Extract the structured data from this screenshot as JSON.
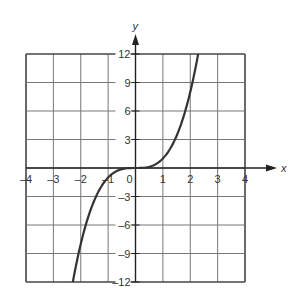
{
  "chart_data": {
    "type": "line",
    "title": "",
    "xlabel": "x",
    "ylabel": "y",
    "xlim": [
      -4,
      4
    ],
    "ylim": [
      -12,
      12
    ],
    "grid": true,
    "x_ticks": [
      "-4",
      "-3",
      "-2",
      "-1",
      "0",
      "1",
      "2",
      "3",
      "4"
    ],
    "y_ticks": [
      "12",
      "9",
      "6",
      "3",
      "-3",
      "-6",
      "-9",
      "-12"
    ],
    "series": [
      {
        "name": "y = x^3",
        "x": [
          -2.29,
          -2,
          -1.5,
          -1,
          -0.5,
          0,
          0.5,
          1,
          1.5,
          2,
          2.29
        ],
        "y": [
          -12,
          -8,
          -3.375,
          -1,
          -0.125,
          0,
          0.125,
          1,
          3.375,
          8,
          12
        ]
      }
    ],
    "colors": {
      "curve": "#333333",
      "grid": "#555555",
      "axis": "#222222"
    }
  }
}
